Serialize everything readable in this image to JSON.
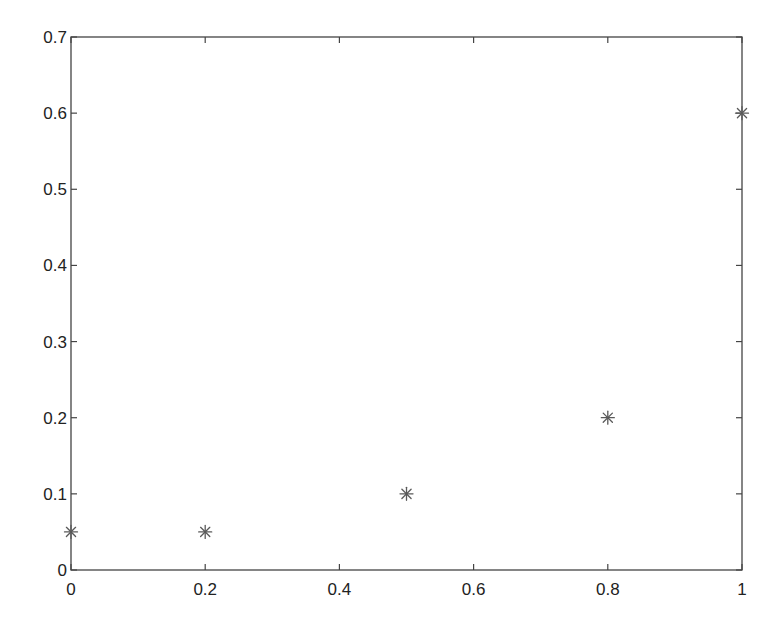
{
  "chart_data": {
    "type": "scatter",
    "title": "",
    "xlabel": "",
    "ylabel": "",
    "xlim": [
      0,
      1
    ],
    "ylim": [
      0,
      0.7
    ],
    "grid": false,
    "legend": null,
    "marker": "asterisk",
    "marker_color": "#5a5a5a",
    "axis_color": "#444444",
    "x_ticks": [
      0,
      0.2,
      0.4,
      0.6,
      0.8,
      1
    ],
    "x_tick_labels": [
      "0",
      "0.2",
      "0.4",
      "0.6",
      "0.8",
      "1"
    ],
    "y_ticks": [
      0,
      0.1,
      0.2,
      0.3,
      0.4,
      0.5,
      0.6,
      0.7
    ],
    "y_tick_labels": [
      "0",
      "0.1",
      "0.2",
      "0.3",
      "0.4",
      "0.5",
      "0.6",
      "0.7"
    ],
    "series": [
      {
        "name": "data",
        "x": [
          0,
          0.2,
          0.5,
          0.8,
          1
        ],
        "y": [
          0.05,
          0.05,
          0.1,
          0.2,
          0.6
        ]
      }
    ]
  },
  "layout": {
    "plot_left": 71,
    "plot_right": 742,
    "plot_top": 37,
    "plot_bottom": 570,
    "tick_length": 6,
    "marker_radius": 6.5
  }
}
